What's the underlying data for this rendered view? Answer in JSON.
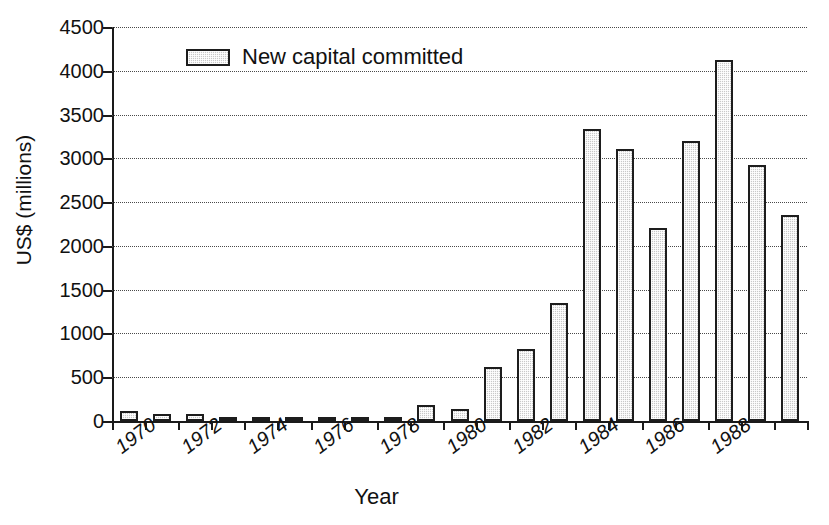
{
  "chart_data": {
    "type": "bar",
    "title": "",
    "xlabel": "Year",
    "ylabel": "US$ (millions)",
    "ylim": [
      0,
      4500
    ],
    "ytick_values": [
      0,
      500,
      1000,
      1500,
      2000,
      2500,
      3000,
      3500,
      4000,
      4500
    ],
    "ytick_labels": [
      "0",
      "500",
      "1000",
      "1500",
      "2000",
      "2500",
      "3000",
      "3500",
      "4000",
      "4500"
    ],
    "grid": true,
    "legend_position": "upper-left-inside",
    "legend": [
      "New capital committed"
    ],
    "series_name": "New capital committed",
    "categories": [
      1970,
      1971,
      1972,
      1973,
      1974,
      1975,
      1976,
      1977,
      1978,
      1979,
      1980,
      1981,
      1982,
      1983,
      1984,
      1985,
      1986,
      1987,
      1988,
      1989
    ],
    "xtick_labels": [
      "1970",
      "1972",
      "1974",
      "1976",
      "1978",
      "1980",
      "1982",
      "1984",
      "1986",
      "1988"
    ],
    "xtick_label_years": [
      1970,
      1972,
      1974,
      1976,
      1978,
      1980,
      1982,
      1984,
      1986,
      1988
    ],
    "values": [
      120,
      80,
      80,
      30,
      35,
      35,
      10,
      25,
      15,
      185,
      140,
      620,
      820,
      1350,
      3330,
      3110,
      2210,
      3200,
      4120,
      2920
    ],
    "bar_labels": [
      {
        "year": 1970,
        "value": 120
      },
      {
        "year": 1971,
        "value": 80
      },
      {
        "year": 1972,
        "value": 80
      },
      {
        "year": 1973,
        "value": 30
      },
      {
        "year": 1974,
        "value": 35
      },
      {
        "year": 1975,
        "value": 35
      },
      {
        "year": 1976,
        "value": 10
      },
      {
        "year": 1977,
        "value": 25
      },
      {
        "year": 1978,
        "value": 15
      },
      {
        "year": 1979,
        "value": 185
      },
      {
        "year": 1980,
        "value": 140
      },
      {
        "year": 1981,
        "value": 620
      },
      {
        "year": 1982,
        "value": 820
      },
      {
        "year": 1983,
        "value": 1350
      },
      {
        "year": 1984,
        "value": 3330
      },
      {
        "year": 1985,
        "value": 3110
      },
      {
        "year": 1986,
        "value": 2210
      },
      {
        "year": 1987,
        "value": 3200
      },
      {
        "year": 1988,
        "value": 4120
      },
      {
        "year": 1989,
        "value": 2920
      },
      {
        "year": 1990,
        "value": 2350
      }
    ]
  },
  "colors": {
    "bar_fill": "#c9c9c9",
    "bar_edge": "#1d1d1d",
    "axis": "#1a1a1a",
    "grid": "#4a4a4a",
    "background": "#ffffff",
    "text": "#111111"
  },
  "axes": {
    "y_title": "US$ (millions)",
    "x_title": "Year"
  },
  "legend": {
    "label": "New capital committed",
    "swatch": "bar-swatch"
  }
}
